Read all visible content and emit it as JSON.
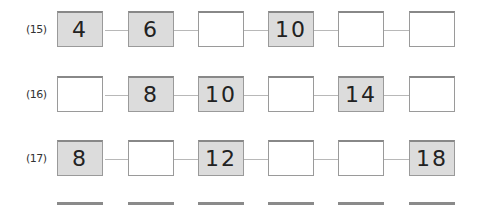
{
  "problems": [
    {
      "number": "(15)",
      "cells": [
        {
          "value": "4",
          "given": true
        },
        {
          "value": "6",
          "given": true
        },
        {
          "value": "",
          "given": false
        },
        {
          "value": "10",
          "given": true
        },
        {
          "value": "",
          "given": false
        },
        {
          "value": "",
          "given": false
        }
      ]
    },
    {
      "number": "(16)",
      "cells": [
        {
          "value": "",
          "given": false
        },
        {
          "value": "8",
          "given": true
        },
        {
          "value": "10",
          "given": true
        },
        {
          "value": "",
          "given": false
        },
        {
          "value": "14",
          "given": true
        },
        {
          "value": "",
          "given": false
        }
      ]
    },
    {
      "number": "(17)",
      "cells": [
        {
          "value": "8",
          "given": true
        },
        {
          "value": "",
          "given": false
        },
        {
          "value": "12",
          "given": true
        },
        {
          "value": "",
          "given": false
        },
        {
          "value": "",
          "given": false
        },
        {
          "value": "18",
          "given": true
        }
      ]
    }
  ]
}
